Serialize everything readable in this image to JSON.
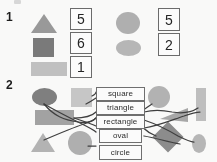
{
  "worksheet": {
    "exercises": [
      {
        "number": "1",
        "groups": [
          {
            "name": "left-group",
            "shapes": [
              {
                "icon": "triangle-shape",
                "tone": "#9a9a9a"
              },
              {
                "icon": "square-shape",
                "tone": "#7a7a7a"
              },
              {
                "icon": "rectangle-shape",
                "tone": "#c2c2c2"
              }
            ],
            "answers": [
              "5",
              "6",
              "1"
            ]
          },
          {
            "name": "right-group",
            "shapes": [
              {
                "icon": "circle-shape",
                "tone": "#b0b0b0"
              },
              {
                "icon": "oval-shape",
                "tone": "#b8b8b8"
              }
            ],
            "answers": [
              "5",
              "2"
            ]
          }
        ]
      },
      {
        "number": "2",
        "labels": [
          {
            "id": "square",
            "text": "square"
          },
          {
            "id": "triangle",
            "text": "triangle"
          },
          {
            "id": "rectangle",
            "text": "rectangle"
          },
          {
            "id": "oval",
            "text": "oval"
          },
          {
            "id": "circle",
            "text": "circle"
          }
        ],
        "left_shapes": [
          {
            "icon": "oval-shape",
            "tone": "#7f7f7f"
          },
          {
            "icon": "square-shape",
            "tone": "#c8c8c8"
          },
          {
            "icon": "rectangle-shape",
            "tone": "#a3a3a3"
          },
          {
            "icon": "triangle-shape",
            "tone": "#b5b5b5"
          },
          {
            "icon": "circle-shape",
            "tone": "#b0b0b0"
          }
        ],
        "right_shapes": [
          {
            "icon": "circle-shape",
            "tone": "#b4b4b4"
          },
          {
            "icon": "rectangle-shape",
            "tone": "#c0c0c0"
          },
          {
            "icon": "triangle-shape",
            "tone": "#a8a8a8"
          },
          {
            "icon": "diamond-shape",
            "tone": "#8c8c8c"
          },
          {
            "icon": "oval-shape",
            "tone": "#b8b8b8"
          }
        ]
      }
    ]
  },
  "colors": {
    "paper": "#fdfdfc",
    "ink": "#3d3d3d",
    "box_border": "#6a6a6a"
  }
}
